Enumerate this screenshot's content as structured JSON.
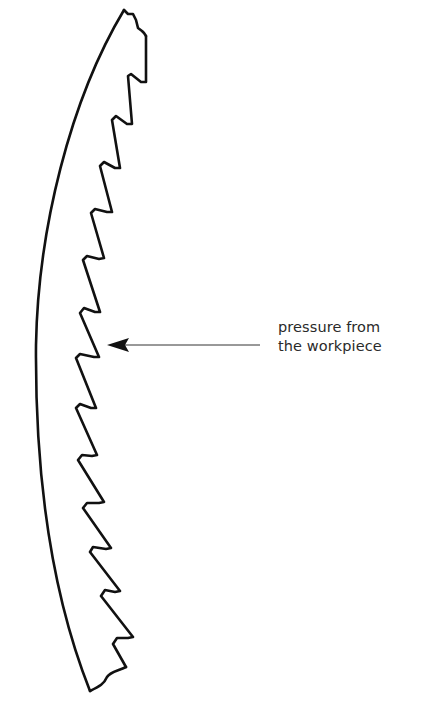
{
  "diagram": {
    "annotation": {
      "lines": [
        "pressure from",
        "the workpiece"
      ],
      "arrow_direction": "left"
    },
    "colors": {
      "stroke": "#111111",
      "text": "#2a2a2a",
      "background": "#ffffff"
    }
  }
}
